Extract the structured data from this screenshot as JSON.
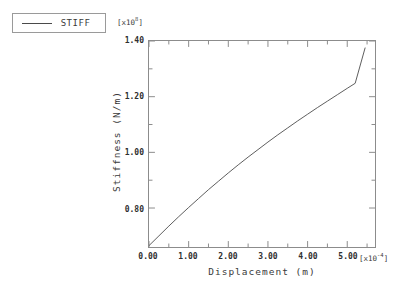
{
  "legend": {
    "entries": [
      {
        "label": "STIFF",
        "color": "#4a4a4a",
        "style": "solid-line"
      }
    ]
  },
  "axes": {
    "y_exponent_prefix": "[x10",
    "y_exponent_value": "8",
    "y_exponent_suffix": "]",
    "x_exponent_prefix": "[x10",
    "x_exponent_value": "-4",
    "x_exponent_suffix": "]"
  },
  "caption": {
    "text": ""
  },
  "chart_data": {
    "type": "line",
    "title": "",
    "xlabel": "Displacement (m)",
    "ylabel": "Stiffness (N/m)",
    "x_scale_exponent": -4,
    "y_scale_exponent": 8,
    "xlim": [
      0.0,
      5.7
    ],
    "ylim": [
      0.66,
      1.4
    ],
    "grid": false,
    "legend_position": "outside-top-left",
    "x_ticks": [
      0.0,
      1.0,
      2.0,
      3.0,
      4.0,
      5.0
    ],
    "x_tick_labels": [
      "0.00",
      "1.00",
      "2.00",
      "3.00",
      "4.00",
      "5.00"
    ],
    "x_minor_ticks_between": 1,
    "y_ticks": [
      0.8,
      1.0,
      1.2,
      1.4
    ],
    "y_tick_labels": [
      "0.80",
      "1.00",
      "1.20",
      "1.40"
    ],
    "y_minor_ticks_between": 1,
    "series": [
      {
        "name": "STIFF",
        "color": "#4a4a4a",
        "x": [
          0.0,
          0.25,
          0.5,
          0.75,
          1.0,
          1.25,
          1.5,
          1.75,
          2.0,
          2.25,
          2.5,
          2.75,
          3.0,
          3.25,
          3.5,
          3.75,
          4.0,
          4.25,
          4.5,
          4.75,
          5.0,
          5.2,
          5.45
        ],
        "y": [
          0.665,
          0.7,
          0.735,
          0.769,
          0.802,
          0.834,
          0.866,
          0.896,
          0.926,
          0.955,
          0.983,
          1.01,
          1.037,
          1.063,
          1.088,
          1.113,
          1.137,
          1.161,
          1.184,
          1.207,
          1.23,
          1.248,
          1.375
        ]
      }
    ]
  }
}
